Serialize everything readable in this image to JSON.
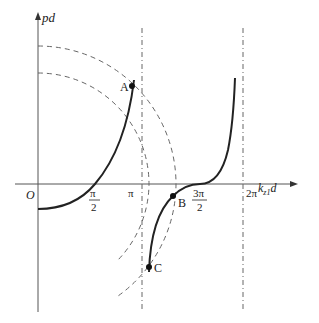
{
  "figure": {
    "y_axis_label": "pd",
    "x_axis_label_main": "k",
    "x_axis_label_sub": "z1",
    "x_axis_label_tail": "d",
    "origin_label": "O",
    "ticks": {
      "half_pi_num": "π",
      "half_pi_den": "2",
      "pi": "π",
      "three_half_pi_num": "3π",
      "three_half_pi_den": "2",
      "two_pi": "2π"
    },
    "points": {
      "A": "A",
      "B": "B",
      "C": "C"
    },
    "colors": {
      "axis": "#555555",
      "curve": "#222222",
      "dashed": "#666666"
    }
  }
}
